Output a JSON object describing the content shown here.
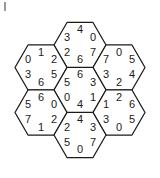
{
  "puzzle": {
    "title": "Hexagonal triangle digit puzzle",
    "shape": "hexagon-flower",
    "hex_count": 7,
    "cells_per_hex": 6,
    "colors": {
      "outline": "#1a1a1a",
      "spoke": "#b9b9b9",
      "digit": "#1a1a1a",
      "background": "#ffffff",
      "tick": "#6f6f6f"
    },
    "geometry": {
      "center_x": 80,
      "center_y": 90,
      "hex_radius": 26,
      "ring_step_x": 39,
      "ring_step_y": 22.5
    },
    "corner_tick": {
      "name": "crop-tick-mark",
      "x": 5,
      "y1": 2,
      "y2": 11
    },
    "hexes": [
      {
        "id": "hex-top",
        "label": "top",
        "cx": 80,
        "cy": 45,
        "cells": {
          "top": "4",
          "upper_left": "3",
          "upper_right": "0",
          "lower_left": "2",
          "bottom": "6",
          "lower_right": "7"
        }
      },
      {
        "id": "hex-upper-left",
        "label": "upper-left",
        "cx": 41,
        "cy": 67.5,
        "cells": {
          "top": "1",
          "upper_left": "0",
          "upper_right": "2",
          "lower_left": "3",
          "bottom": "6",
          "lower_right": "5"
        }
      },
      {
        "id": "hex-upper-right",
        "label": "upper-right",
        "cx": 119,
        "cy": 67.5,
        "cells": {
          "top": "0",
          "upper_left": "7",
          "upper_right": "5",
          "lower_left": "3",
          "bottom": "2",
          "lower_right": "4"
        }
      },
      {
        "id": "hex-center",
        "label": "center",
        "cx": 80,
        "cy": 90,
        "cells": {
          "top": "6",
          "upper_left": "5",
          "upper_right": "3",
          "lower_left": "0",
          "bottom": "4",
          "lower_right": "1"
        }
      },
      {
        "id": "hex-lower-left",
        "label": "lower-left",
        "cx": 41,
        "cy": 112.5,
        "cells": {
          "top": "6",
          "upper_left": "5",
          "upper_right": "0",
          "lower_left": "7",
          "bottom": "1",
          "lower_right": "2"
        }
      },
      {
        "id": "hex-lower-right",
        "label": "lower-right",
        "cx": 119,
        "cy": 112.5,
        "cells": {
          "top": "2",
          "upper_left": "1",
          "upper_right": "6",
          "lower_left": "3",
          "bottom": "0",
          "lower_right": "5"
        }
      },
      {
        "id": "hex-bottom",
        "label": "bottom",
        "cx": 80,
        "cy": 135,
        "cells": {
          "top": "4",
          "upper_left": "2",
          "upper_right": "3",
          "lower_left": "5",
          "bottom": "0",
          "lower_right": "7"
        }
      }
    ]
  }
}
